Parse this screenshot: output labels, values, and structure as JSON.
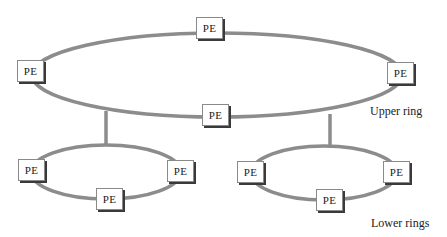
{
  "diagram": {
    "ring_color": "#8c8c8c",
    "upper_ring": {
      "label": "Upper ring",
      "nodes": [
        "PE",
        "PE",
        "PE",
        "PE"
      ]
    },
    "lower_rings": {
      "label": "Lower rings",
      "left": {
        "nodes": [
          "PE",
          "PE",
          "PE"
        ]
      },
      "right": {
        "nodes": [
          "PE",
          "PE",
          "PE"
        ]
      }
    }
  }
}
